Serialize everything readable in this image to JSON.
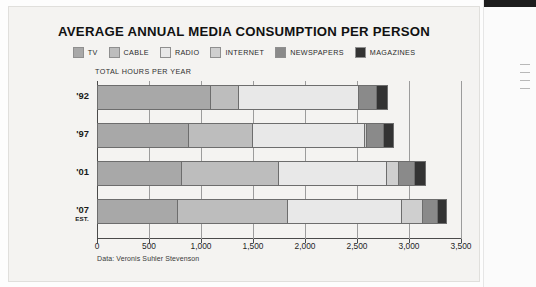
{
  "card": {
    "title": "AVERAGE ANNUAL MEDIA CONSUMPTION PER PERSON",
    "axis_caption": "TOTAL HOURS PER YEAR",
    "source": "Data: Veronis Suhler Stevenson"
  },
  "colors": {
    "tv": "#a8a8a8",
    "cable": "#bdbdbd",
    "radio": "#e8e8e8",
    "internet": "#cfcfcf",
    "newspapers": "#8a8a8a",
    "magazines": "#333333",
    "card_bg": "#f4f3f1",
    "axis": "#4a4a4a",
    "grid": "#9c9c9c"
  },
  "chart_data": {
    "type": "bar",
    "orientation": "horizontal",
    "stacked": true,
    "title": "AVERAGE ANNUAL MEDIA CONSUMPTION PER PERSON",
    "xlabel": "TOTAL HOURS PER YEAR",
    "ylabel": "",
    "xlim": [
      0,
      3500
    ],
    "grid": true,
    "legend_position": "top",
    "categories": [
      "'92",
      "'97",
      "'01",
      "'07"
    ],
    "category_notes": [
      "",
      "",
      "",
      "EST."
    ],
    "tick_values": [
      0,
      500,
      1000,
      1500,
      2000,
      2500,
      3000,
      3500
    ],
    "tick_labels": [
      "0",
      "500",
      "1,000",
      "1,500",
      "2,000",
      "2,500",
      "3,000",
      "3,500"
    ],
    "series": [
      {
        "name": "TV",
        "color": "#a8a8a8",
        "values": [
          1100,
          880,
          820,
          780
        ]
      },
      {
        "name": "CABLE",
        "color": "#bdbdbd",
        "values": [
          270,
          620,
          930,
          1060
        ]
      },
      {
        "name": "RADIO",
        "color": "#e8e8e8",
        "values": [
          1150,
          1080,
          1040,
          1090
        ]
      },
      {
        "name": "INTERNET",
        "color": "#cfcfcf",
        "values": [
          0,
          20,
          110,
          200
        ]
      },
      {
        "name": "NEWSPAPERS",
        "color": "#8a8a8a",
        "values": [
          170,
          160,
          160,
          150
        ]
      },
      {
        "name": "MAGAZINES",
        "color": "#333333",
        "values": [
          110,
          100,
          100,
          90
        ]
      }
    ],
    "totals": [
      2800,
      2860,
      3160,
      3370
    ]
  },
  "legend": {
    "items": [
      {
        "label": "TV",
        "color": "#a8a8a8"
      },
      {
        "label": "CABLE",
        "color": "#bdbdbd"
      },
      {
        "label": "RADIO",
        "color": "#e8e8e8"
      },
      {
        "label": "INTERNET",
        "color": "#cfcfcf"
      },
      {
        "label": "NEWSPAPERS",
        "color": "#8a8a8a"
      },
      {
        "label": "MAGAZINES",
        "color": "#333333"
      }
    ]
  }
}
